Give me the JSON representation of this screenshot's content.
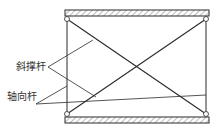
{
  "diagram": {
    "labels": {
      "diagonal_brace": "斜撑杆",
      "axial_rod": "轴向杆"
    },
    "colors": {
      "line": "#2a2a2a",
      "hatch": "#555555",
      "background": "#ffffff"
    }
  }
}
